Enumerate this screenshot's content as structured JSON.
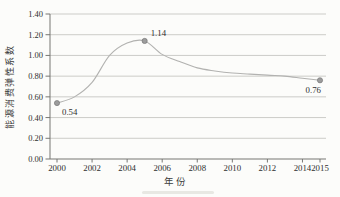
{
  "figure": {
    "kind": "scanned line chart",
    "background": "#fcfcfa"
  },
  "colors": {
    "grid": "#ccccc8",
    "axis": "#777773",
    "line": "#b2b2b0",
    "marker_fill": "#9c9c9c",
    "marker_stroke": "#6f6f6f",
    "text": "#2f2f2f"
  },
  "chart_data": {
    "type": "line",
    "smoothed": true,
    "title": "",
    "xlabel": "年份",
    "ylabel": "能源消费弹性系数",
    "x": [
      2000,
      2001,
      2002,
      2003,
      2004,
      2005,
      2006,
      2007,
      2008,
      2009,
      2010,
      2011,
      2012,
      2013,
      2014,
      2015
    ],
    "values": [
      0.54,
      0.6,
      0.74,
      1.0,
      1.12,
      1.14,
      1.01,
      0.94,
      0.88,
      0.85,
      0.83,
      0.82,
      0.81,
      0.8,
      0.78,
      0.76
    ],
    "ylim": [
      0.0,
      1.4
    ],
    "xlim": [
      1999.6,
      2015.3
    ],
    "y_ticks": [
      "0.00",
      "0.20",
      "0.40",
      "0.60",
      "0.80",
      "1.00",
      "1.20",
      "1.40"
    ],
    "x_ticks": [
      2000,
      2002,
      2004,
      2006,
      2008,
      2010,
      2012,
      2014,
      2015
    ],
    "grid": true,
    "legend": "none",
    "annotations": [
      {
        "x": 2000,
        "y": 0.54,
        "text": "0.54",
        "placement": "below-right"
      },
      {
        "x": 2005,
        "y": 1.14,
        "text": "1.14",
        "placement": "above-right"
      },
      {
        "x": 2015,
        "y": 0.76,
        "text": "0.76",
        "placement": "below-left"
      }
    ]
  }
}
